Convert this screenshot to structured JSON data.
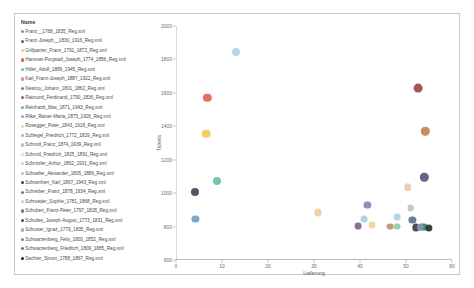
{
  "legend": {
    "title": "Name",
    "items": [
      {
        "label": "Franz__1768_1835_Reg.xml",
        "color": "#8a8ab5"
      },
      {
        "label": "Franz-Joseph__1830_1916_Reg.xml",
        "color": "#5b5f7a"
      },
      {
        "label": "Grillparzer_Franz_1791_1872_Reg.xml",
        "color": "#f0cf63"
      },
      {
        "label": "Hammer-Purgstall_Joseph_1774_1856_Reg.xml",
        "color": "#d9604c"
      },
      {
        "label": "Hitler_Adolf_1889_1945_Reg.xml",
        "color": "#7fb9a4"
      },
      {
        "label": "Karl_Franz-Joseph_1887_1922_Reg.xml",
        "color": "#e08d8d"
      },
      {
        "label": "Nestroy_Johann_1801_1862_Reg.xml",
        "color": "#6f7fa8"
      },
      {
        "label": "Raimund_Ferdinand_1790_1836_Reg.xml",
        "color": "#a55b62"
      },
      {
        "label": "Reinhardt_Max_1871_1943_Reg.xml",
        "color": "#8d9ab0"
      },
      {
        "label": "Rilke_Rainer-Maria_1875_1926_Reg.xml",
        "color": "#8fa9c4"
      },
      {
        "label": "Rosegger_Peter_1843_1918_Reg.xml",
        "color": "#f2d488"
      },
      {
        "label": "Schlegel_Friedrich_1772_1829_Reg.xml",
        "color": "#e0a0a0"
      },
      {
        "label": "Schmid_Franz_1874_1939_Reg.xml",
        "color": "#b9bccd"
      },
      {
        "label": "Schmid_Friedrich_1825_1891_Reg.xml",
        "color": "#d9dde6"
      },
      {
        "label": "Schnitzler_Arthur_1862_1931_Reg.xml",
        "color": "#eec9a8"
      },
      {
        "label": "Schoeller_Alexander_1805_1886_Reg.xml",
        "color": "#a9c3d6"
      },
      {
        "label": "Schoenherr_Karl_1867_1943_Reg.xml",
        "color": "#3a3f55"
      },
      {
        "label": "Schreiber_Franz_1878_1934_Reg.xml",
        "color": "#6a7390"
      },
      {
        "label": "Schroeder_Sophie_1781_1868_Reg.xml",
        "color": "#f0c79a"
      },
      {
        "label": "Schubert_Franz-Peter_1797_1828_Reg.xml",
        "color": "#6e7ea8"
      },
      {
        "label": "Schultes_Joseph-August_1773_1831_Reg.xml",
        "color": "#3f4a63"
      },
      {
        "label": "Schuster_Ignaz_1779_1835_Reg.xml",
        "color": "#c2a98f"
      },
      {
        "label": "Schwarzenberg_Felix_1800_1852_Reg.xml",
        "color": "#7d8496"
      },
      {
        "label": "Schwarzenberg_Friedrich_1809_1885_Reg.xml",
        "color": "#6b6f82"
      },
      {
        "label": "Sechter_Simon_1788_1867_Reg.xml",
        "color": "#23262f"
      }
    ]
  },
  "chart_data": {
    "type": "scatter",
    "title": "",
    "xlabel": "Lieferung",
    "ylabel": "Tickets",
    "xlim": [
      0,
      60
    ],
    "ylim": [
      600,
      2000
    ],
    "xticks": [
      0,
      10,
      20,
      30,
      40,
      50,
      60
    ],
    "yticks": [
      600,
      800,
      1000,
      1200,
      1400,
      1600,
      1800,
      2000
    ],
    "grid": false,
    "legend_position": "left",
    "points": [
      {
        "name": "Hitler_Adolf_1889_1945_Reg.xml",
        "x": 13.0,
        "y": 1845,
        "color": "#a8d3e8",
        "r": 4.0
      },
      {
        "name": "Hammer-Purgstall_Joseph_1774_1856_Reg.xml",
        "x": 6.8,
        "y": 1570,
        "color": "#d9604c",
        "r": 4.2
      },
      {
        "name": "Raimund_Ferdinand_1790_1836_Reg.xml",
        "x": 52.6,
        "y": 1630,
        "color": "#9e3f3f",
        "r": 4.4
      },
      {
        "name": "Grillparzer_Franz_1791_1872_Reg.xml",
        "x": 6.6,
        "y": 1355,
        "color": "#edc95a",
        "r": 4.2
      },
      {
        "name": "Schuster_Ignaz_1779_1835_Reg.xml",
        "x": 54.2,
        "y": 1370,
        "color": "#c07d45",
        "r": 4.2
      },
      {
        "name": "Schwarzenberg_Friedrich_1809_1885_Reg.xml",
        "x": 54.0,
        "y": 1095,
        "color": "#5a4a78",
        "r": 4.2
      },
      {
        "name": "Schoeller_Alexander_1805_1886_Reg.xml",
        "x": 9.0,
        "y": 1070,
        "color": "#66bb9a",
        "r": 4.0
      },
      {
        "name": "Schoenherr_Karl_1867_1943_Reg.xml",
        "x": 4.1,
        "y": 1005,
        "color": "#3a3f55",
        "r": 4.0
      },
      {
        "name": "Schnitzler_Arthur_1862_1931_Reg.xml",
        "x": 50.4,
        "y": 1035,
        "color": "#eec9a8",
        "r": 3.8
      },
      {
        "name": "Schubert_Franz-Peter_1797_1828_Reg.xml",
        "x": 4.2,
        "y": 845,
        "color": "#6e9cc4",
        "r": 3.6
      },
      {
        "name": "Reinhardt_Max_1871_1943_Reg.xml",
        "x": 41.6,
        "y": 930,
        "color": "#7b84aa",
        "r": 3.6
      },
      {
        "name": "Schmid_Franz_1874_1939_Reg.xml",
        "x": 51.0,
        "y": 910,
        "color": "#b9bccd",
        "r": 3.4
      },
      {
        "name": "Schroeder_Sophie_1781_1868_Reg.xml",
        "x": 30.8,
        "y": 885,
        "color": "#f0c79a",
        "r": 3.6
      },
      {
        "name": "Rilke_Rainer-Maria_1875_1926_Reg.xml",
        "x": 48.1,
        "y": 855,
        "color": "#a9d3e0",
        "r": 3.4
      },
      {
        "name": "Schlegel_Friedrich_1772_1829_Reg.xml",
        "x": 40.9,
        "y": 845,
        "color": "#a9c8e0",
        "r": 3.4
      },
      {
        "name": "Schwarzenberg_Felix_1800_1852_Reg.xml",
        "x": 51.4,
        "y": 840,
        "color": "#5a6a88",
        "r": 3.6
      },
      {
        "name": "Karl_Franz-Joseph_1887_1922_Reg.xml",
        "x": 42.6,
        "y": 810,
        "color": "#efd19a",
        "r": 3.4
      },
      {
        "name": "Franz__1768_1835_Reg.xml",
        "x": 39.6,
        "y": 805,
        "color": "#7a5f80",
        "r": 3.4
      },
      {
        "name": "Nestroy_Johann_1801_1862_Reg.xml",
        "x": 46.6,
        "y": 800,
        "color": "#c08a6a",
        "r": 3.4
      },
      {
        "name": "Schmid_Friedrich_1825_1891_Reg.xml",
        "x": 48.0,
        "y": 800,
        "color": "#8fc9a8",
        "r": 3.4
      },
      {
        "name": "Schreiber_Franz_1878_1934_Reg.xml",
        "x": 52.2,
        "y": 795,
        "color": "#2e3240",
        "r": 3.6
      },
      {
        "name": "Schultes_Joseph-August_1773_1831_Reg.xml",
        "x": 53.4,
        "y": 797,
        "color": "#4a5570",
        "r": 3.4
      },
      {
        "name": "Franz-Joseph__1830_1916_Reg.xml",
        "x": 53.9,
        "y": 795,
        "color": "#3f7a6a",
        "r": 3.4
      },
      {
        "name": "Sechter_Simon_1788_1867_Reg.xml",
        "x": 54.9,
        "y": 793,
        "color": "#23262f",
        "r": 3.6
      },
      {
        "name": "Rosegger_Peter_1843_1918_Reg.xml",
        "x": 53.1,
        "y": 795,
        "color": "#8a9ab0",
        "r": 3.2
      }
    ]
  }
}
